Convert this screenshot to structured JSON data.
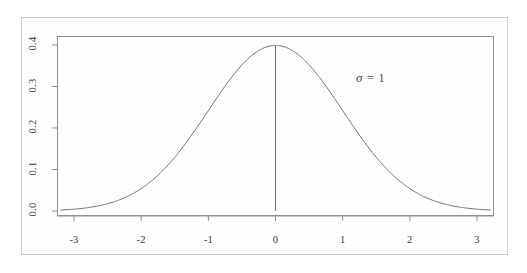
{
  "figure": {
    "background_color": "#fefefe",
    "frame_color": "#c9c9c9",
    "plot_box_color": "#8f8f8f",
    "curve_color": "#6e6e6e",
    "axis_color": "#8f8f8f",
    "tick_label_color": "#3a3a3a"
  },
  "annotation": {
    "sigma_symbol": "σ",
    "equals": "=",
    "value": "1",
    "full_text": "σ = 1"
  },
  "chart_data": {
    "type": "line",
    "title": "",
    "subtitle": "",
    "xlabel": "",
    "ylabel": "",
    "xlim": [
      -3.2,
      3.2
    ],
    "ylim": [
      0.0,
      0.41
    ],
    "grid": false,
    "legend": null,
    "xticks": [
      -3,
      -2,
      -1,
      0,
      1,
      2,
      3
    ],
    "xtick_labels": [
      "-3",
      "-2",
      "-1",
      "0",
      "1",
      "2",
      "3"
    ],
    "yticks": [
      0.0,
      0.1,
      0.2,
      0.3,
      0.4
    ],
    "ytick_labels": [
      "0.0",
      "0.1",
      "0.2",
      "0.3",
      "0.4"
    ],
    "ytick_labels_rotated": true,
    "annotations": [
      {
        "text": "σ = 1",
        "x": 1.5,
        "y": 0.335
      }
    ],
    "vertical_reference_line": {
      "x": 0,
      "y_from": 0.0,
      "y_to": 0.3989
    },
    "series": [
      {
        "name": "Standard normal density",
        "distribution": "normal",
        "mean": 0,
        "sigma": 1,
        "peak_value": 0.3989,
        "x": [
          -3.2,
          -3.0,
          -2.8,
          -2.6,
          -2.4,
          -2.2,
          -2.0,
          -1.8,
          -1.6,
          -1.4,
          -1.2,
          -1.0,
          -0.8,
          -0.6,
          -0.4,
          -0.2,
          0.0,
          0.2,
          0.4,
          0.6,
          0.8,
          1.0,
          1.2,
          1.4,
          1.6,
          1.8,
          2.0,
          2.2,
          2.4,
          2.6,
          2.8,
          3.0,
          3.2
        ],
        "values": [
          0.0024,
          0.0044,
          0.0079,
          0.0136,
          0.0224,
          0.0355,
          0.054,
          0.079,
          0.1109,
          0.1497,
          0.1942,
          0.242,
          0.2897,
          0.3332,
          0.3683,
          0.391,
          0.3989,
          0.391,
          0.3683,
          0.3332,
          0.2897,
          0.242,
          0.1942,
          0.1497,
          0.1109,
          0.079,
          0.054,
          0.0355,
          0.0224,
          0.0136,
          0.0079,
          0.0044,
          0.0024
        ]
      }
    ]
  }
}
